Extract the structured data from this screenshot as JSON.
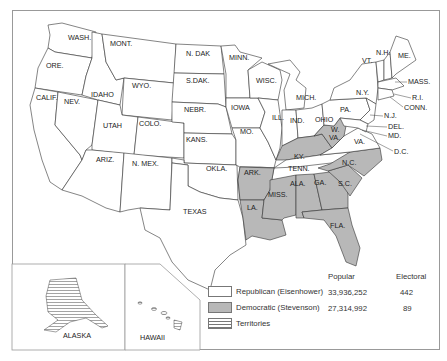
{
  "map": {
    "state_labels": {
      "wash": "WASH.",
      "ore": "ORE.",
      "calif": "CALIF.",
      "nev": "NEV.",
      "idaho": "IDAHO",
      "mont": "MONT.",
      "wyo": "WYO.",
      "utah": "UTAH",
      "colo": "COLO.",
      "ariz": "ARIZ.",
      "nmex": "N. MEX.",
      "ndak": "N. DAK",
      "sdak": "S.DAK.",
      "nebr": "NEBR.",
      "kans": "KANS.",
      "okla": "OKLA.",
      "texas": "TEXAS",
      "minn": "MINN.",
      "iowa": "IOWA",
      "mo": "MO.",
      "ark": "ARK.",
      "la": "LA.",
      "wisc": "WISC.",
      "ill": "ILL.",
      "mich": "MICH.",
      "ind": "IND.",
      "ohio": "OHIO",
      "ky": "KY.",
      "tenn": "TENN.",
      "miss": "MISS.",
      "ala": "ALA.",
      "ga": "GA.",
      "fla": "FLA.",
      "sc": "S.C.",
      "nc": "N.C.",
      "va": "VA.",
      "wva": "W.\nVA.",
      "pa": "PA.",
      "ny": "N.Y.",
      "nj": "N.J.",
      "del": "DEL.",
      "md": "MD.",
      "dc": "D.C.",
      "vt": "VT.",
      "nh": "N.H.",
      "me": "ME.",
      "mass": "MASS.",
      "ri": "R.I.",
      "conn": "CONN.",
      "alaska": "ALASKA",
      "hawaii": "HAWAII"
    },
    "democratic_states": [
      "ARK.",
      "LA.",
      "MISS.",
      "ALA.",
      "GA.",
      "S.C.",
      "N.C.",
      "KY.",
      "W. VA.",
      "FLA."
    ],
    "colors": {
      "republican": "#ffffff",
      "democratic": "#b8b8b8",
      "border": "#333333"
    }
  },
  "legend": {
    "headers": {
      "popular": "Popular",
      "electoral": "Electoral"
    },
    "rows": [
      {
        "label": "Republican (Eisenhower)",
        "popular": "33,936,252",
        "electoral": "442"
      },
      {
        "label": "Democratic (Stevenson)",
        "popular": "27,314,992",
        "electoral": "89"
      },
      {
        "label": "Territories",
        "popular": "",
        "electoral": ""
      }
    ]
  }
}
